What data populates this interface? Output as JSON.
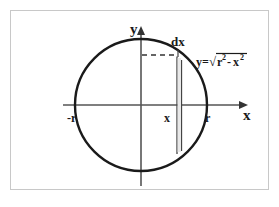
{
  "figure": {
    "background_color": "#ffffff",
    "frame": {
      "color": "#c8c8c8",
      "x": 10.5,
      "y": 10.5,
      "width": 258,
      "height": 179
    },
    "colors": {
      "curve": "#1a1a1a",
      "axis": "#555555",
      "strip": "#444444",
      "dash": "#333333",
      "text": "#1a1a1a"
    },
    "circle": {
      "center_x": 141,
      "center_y": 105,
      "radius": 66,
      "stroke_width": 2.4
    },
    "x_axis": {
      "x1": 63,
      "x2": 248,
      "y": 105,
      "stroke_width": 1.6,
      "arrow": "right"
    },
    "y_axis": {
      "x": 141,
      "y1": 27,
      "y2": 186,
      "stroke_width": 1.6,
      "arrow": "up"
    },
    "strip": {
      "left_x": 177,
      "right_x": 181.5,
      "top_y": 56,
      "bottom_y": 155,
      "stroke_width": 1.2
    },
    "dashed_line": {
      "x1": 142,
      "x2": 177,
      "y": 55,
      "stroke_width": 1.5,
      "dash_pattern": "5,4"
    },
    "labels": {
      "y_axis_label": {
        "text": "y",
        "x": 130,
        "y": 34,
        "size": 15,
        "bold": true
      },
      "x_axis_label": {
        "text": "x",
        "x": 243,
        "y": 120,
        "size": 15,
        "bold": true
      },
      "dx_label": {
        "text": "dx",
        "x": 171,
        "y": 46,
        "size": 13,
        "bold": true
      },
      "neg_r_label": {
        "text": "-r",
        "x": 67,
        "y": 122,
        "size": 12,
        "bold": true
      },
      "r_label": {
        "text": "r",
        "x": 205,
        "y": 122,
        "size": 12,
        "bold": true
      },
      "x_tick_label": {
        "text": "x",
        "x": 164,
        "y": 122,
        "size": 12,
        "bold": true
      }
    },
    "equation": {
      "x": 196,
      "y": 65,
      "size": 11,
      "lead": "y=",
      "radical_glyph": "√",
      "radicand_base_1": "r",
      "radicand_exp_1": "2",
      "operator": "-",
      "radicand_base_2": "x",
      "radicand_exp_2": "2",
      "full_text": "y=√(r²-x²)"
    }
  }
}
